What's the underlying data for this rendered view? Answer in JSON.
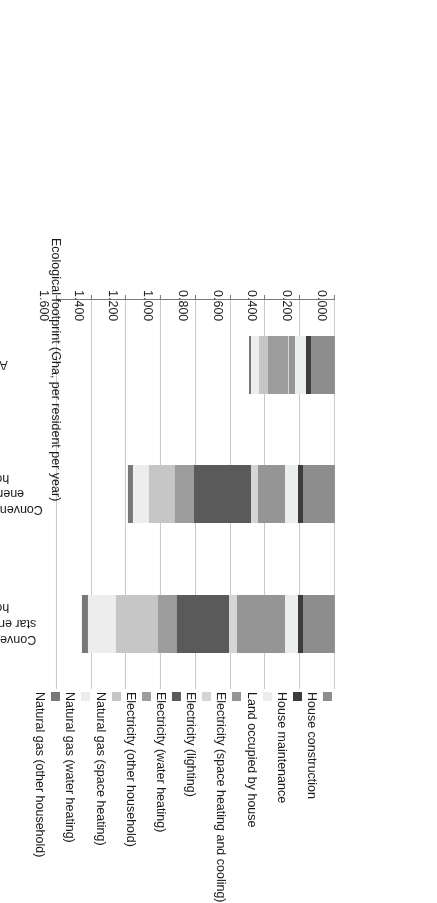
{
  "chart_data": {
    "type": "bar",
    "orientation": "horizontal-stacked",
    "title": "",
    "xlabel": "Ecological footprint (Gha, per resident per year)",
    "ylabel": "",
    "xlim": [
      0.0,
      1.6
    ],
    "xticks": [
      "0.000",
      "0.200",
      "0.400",
      "0.600",
      "0.800",
      "1.000",
      "1.200",
      "1.400",
      "1.600"
    ],
    "xtick_values": [
      0.0,
      0.2,
      0.4,
      0.6,
      0.8,
      1.0,
      1.2,
      1.4,
      1.6
    ],
    "grid": true,
    "legend_position": "top",
    "categories": [
      "Conventional 2-3 star energy rated houses",
      "Conventional 5 star energy rated houses",
      "Aurora"
    ],
    "series": [
      {
        "name": "House construction",
        "color": "#8d8d8d",
        "values": [
          0.185,
          0.185,
          0.14
        ]
      },
      {
        "name": "House maintenance",
        "color": "#3c3c3c",
        "values": [
          0.03,
          0.03,
          0.028
        ]
      },
      {
        "name": "Land occupied by house",
        "color": "#eceded",
        "values": [
          0.075,
          0.075,
          0.06
        ]
      },
      {
        "name": "Electricity (space heating and cooling)",
        "color": "#959595",
        "values": [
          0.275,
          0.155,
          0.035
        ]
      },
      {
        "name": "Electricity (lighting)",
        "color": "#d5d5d5",
        "values": [
          0.045,
          0.04,
          0.01
        ]
      },
      {
        "name": "Electricity (water heating)",
        "color": "#5a5a5a",
        "values": [
          0.3,
          0.325,
          0.0
        ]
      },
      {
        "name": "Electricity (other household)",
        "color": "#9d9d9d",
        "values": [
          0.11,
          0.11,
          0.11
        ]
      },
      {
        "name": "Natural gas (space heating)",
        "color": "#c6c6c6",
        "values": [
          0.24,
          0.15,
          0.055
        ]
      },
      {
        "name": "Natural gas (water heating)",
        "color": "#ededed",
        "values": [
          0.16,
          0.095,
          0.045
        ]
      },
      {
        "name": "Natural gas (other household)",
        "color": "#787878",
        "values": [
          0.035,
          0.025,
          0.01
        ]
      }
    ],
    "totals": [
      1.455,
      1.19,
      0.493
    ]
  },
  "axis": {
    "title": "Ecological footprint (Gha, per resident per year)",
    "ticks": [
      "0.000",
      "0.200",
      "0.400",
      "0.600",
      "0.800",
      "1.000",
      "1.200",
      "1.400",
      "1.600"
    ]
  },
  "legend": {
    "items": [
      {
        "label": "House construction"
      },
      {
        "label": "House maintenance"
      },
      {
        "label": "Land occupied by house"
      },
      {
        "label": "Electricity (space heating and cooling)"
      },
      {
        "label": "Electricity (lighting)"
      },
      {
        "label": "Electricity (water heating)"
      },
      {
        "label": "Electricity (other household)"
      },
      {
        "label": "Natural gas (space heating)"
      },
      {
        "label": "Natural gas (water heating)"
      },
      {
        "label": "Natural gas (other household)"
      }
    ]
  },
  "categories": [
    {
      "lines": [
        "Conventional 2-3",
        "star energy rated",
        "houses"
      ]
    },
    {
      "lines": [
        "Conventional 5 star",
        "energy rated",
        "houses"
      ]
    },
    {
      "lines": [
        "Aurora"
      ]
    }
  ]
}
